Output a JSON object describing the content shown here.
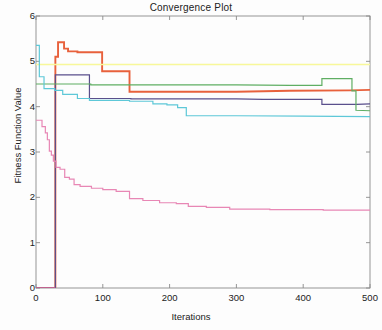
{
  "chart_data": {
    "type": "line",
    "title": "Convergence Plot",
    "xlabel": "Iterations",
    "ylabel": "Fitness Function Value",
    "xlim": [
      0,
      500
    ],
    "ylim": [
      0,
      6
    ],
    "xticks": [
      0,
      100,
      200,
      300,
      400,
      500
    ],
    "yticks": [
      0,
      1,
      2,
      3,
      4,
      5,
      6
    ],
    "grid": false,
    "legend": "none",
    "series": [
      {
        "name": "run-1-red",
        "color": "#e8613c",
        "width": 1.9,
        "points": [
          [
            0,
            0
          ],
          [
            29,
            0
          ],
          [
            29,
            5.1
          ],
          [
            33,
            5.1
          ],
          [
            33,
            5.42
          ],
          [
            42,
            5.42
          ],
          [
            42,
            5.28
          ],
          [
            48,
            5.28
          ],
          [
            48,
            5.22
          ],
          [
            62,
            5.22
          ],
          [
            62,
            5.2
          ],
          [
            99,
            5.2
          ],
          [
            99,
            4.78
          ],
          [
            140,
            4.78
          ],
          [
            140,
            4.33
          ],
          [
            300,
            4.33
          ],
          [
            380,
            4.35
          ],
          [
            470,
            4.36
          ],
          [
            500,
            4.37
          ]
        ]
      },
      {
        "name": "run-2-yellow",
        "color": "#f8f89a",
        "width": 1.4,
        "points": [
          [
            0,
            4.93
          ],
          [
            500,
            4.93
          ]
        ]
      },
      {
        "name": "run-3-navy",
        "color": "#5a4f8c",
        "width": 1.2,
        "points": [
          [
            0,
            0
          ],
          [
            29,
            0
          ],
          [
            29,
            4.7
          ],
          [
            80,
            4.7
          ],
          [
            80,
            4.18
          ],
          [
            142,
            4.18
          ],
          [
            142,
            4.17
          ],
          [
            300,
            4.17
          ],
          [
            340,
            4.16
          ],
          [
            428,
            4.16
          ],
          [
            428,
            4.05
          ],
          [
            480,
            4.05
          ],
          [
            500,
            4.06
          ]
        ]
      },
      {
        "name": "run-4-green",
        "color": "#5fae63",
        "width": 1.2,
        "points": [
          [
            0,
            4.5
          ],
          [
            82,
            4.5
          ],
          [
            82,
            4.48
          ],
          [
            300,
            4.48
          ],
          [
            380,
            4.47
          ],
          [
            428,
            4.47
          ],
          [
            428,
            4.62
          ],
          [
            473,
            4.62
          ],
          [
            473,
            4.35
          ],
          [
            479,
            4.35
          ],
          [
            479,
            3.92
          ],
          [
            500,
            3.91
          ]
        ]
      },
      {
        "name": "run-5-cyan",
        "color": "#5ec8d8",
        "width": 1.2,
        "points": [
          [
            0,
            5.35
          ],
          [
            5,
            5.35
          ],
          [
            5,
            4.66
          ],
          [
            12,
            4.66
          ],
          [
            12,
            4.4
          ],
          [
            28,
            4.4
          ],
          [
            28,
            4.36
          ],
          [
            40,
            4.36
          ],
          [
            40,
            4.27
          ],
          [
            62,
            4.27
          ],
          [
            62,
            4.18
          ],
          [
            80,
            4.18
          ],
          [
            80,
            4.14
          ],
          [
            140,
            4.14
          ],
          [
            140,
            4.12
          ],
          [
            175,
            4.12
          ],
          [
            175,
            4.06
          ],
          [
            196,
            4.06
          ],
          [
            196,
            4.04
          ],
          [
            212,
            4.04
          ],
          [
            212,
            3.98
          ],
          [
            225,
            3.98
          ],
          [
            225,
            3.8
          ],
          [
            300,
            3.8
          ],
          [
            400,
            3.79
          ],
          [
            500,
            3.78
          ]
        ]
      },
      {
        "name": "run-6-pink",
        "color": "#e887b5",
        "width": 1.2,
        "points": [
          [
            0,
            3.7
          ],
          [
            9,
            3.7
          ],
          [
            9,
            3.56
          ],
          [
            14,
            3.56
          ],
          [
            14,
            3.42
          ],
          [
            17,
            3.42
          ],
          [
            17,
            3.27
          ],
          [
            20,
            3.27
          ],
          [
            20,
            3.02
          ],
          [
            23,
            3.02
          ],
          [
            23,
            2.93
          ],
          [
            26,
            2.93
          ],
          [
            26,
            2.8
          ],
          [
            30,
            2.8
          ],
          [
            30,
            2.66
          ],
          [
            36,
            2.66
          ],
          [
            36,
            2.62
          ],
          [
            43,
            2.62
          ],
          [
            43,
            2.44
          ],
          [
            50,
            2.44
          ],
          [
            50,
            2.4
          ],
          [
            57,
            2.4
          ],
          [
            57,
            2.28
          ],
          [
            66,
            2.28
          ],
          [
            66,
            2.24
          ],
          [
            83,
            2.24
          ],
          [
            83,
            2.2
          ],
          [
            100,
            2.2
          ],
          [
            100,
            2.17
          ],
          [
            120,
            2.17
          ],
          [
            120,
            2.13
          ],
          [
            140,
            2.13
          ],
          [
            140,
            1.97
          ],
          [
            160,
            1.97
          ],
          [
            160,
            1.93
          ],
          [
            185,
            1.93
          ],
          [
            185,
            1.88
          ],
          [
            210,
            1.88
          ],
          [
            210,
            1.86
          ],
          [
            228,
            1.86
          ],
          [
            228,
            1.8
          ],
          [
            255,
            1.8
          ],
          [
            255,
            1.78
          ],
          [
            290,
            1.78
          ],
          [
            290,
            1.74
          ],
          [
            350,
            1.74
          ],
          [
            350,
            1.73
          ],
          [
            430,
            1.73
          ],
          [
            430,
            1.72
          ],
          [
            500,
            1.72
          ]
        ]
      },
      {
        "name": "run-7-magenta-baseline",
        "color": "#d46aa8",
        "width": 1.2,
        "points": [
          [
            0,
            0
          ],
          [
            29,
            0
          ]
        ]
      }
    ]
  },
  "axes": {
    "ytick_labels": [
      "6",
      "5",
      "4",
      "3",
      "2",
      "1",
      "0"
    ],
    "xtick_labels": [
      "0",
      "100",
      "200",
      "300",
      "400",
      "500"
    ]
  }
}
